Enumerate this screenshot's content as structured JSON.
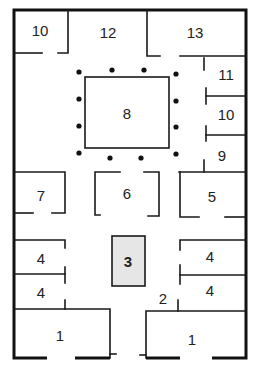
{
  "diagram": {
    "type": "floor-plan",
    "colors": {
      "wall": "#1a1a1a",
      "highlight_fill": "#e6e6e6",
      "column": "#111111",
      "background": "#ffffff"
    },
    "rooms": [
      {
        "id": "r10a",
        "label": "10",
        "x": 40,
        "y": 30
      },
      {
        "id": "r12",
        "label": "12",
        "x": 108,
        "y": 32
      },
      {
        "id": "r13",
        "label": "13",
        "x": 195,
        "y": 32
      },
      {
        "id": "r11",
        "label": "11",
        "x": 226,
        "y": 74
      },
      {
        "id": "r10b",
        "label": "10",
        "x": 226,
        "y": 114
      },
      {
        "id": "r9",
        "label": "9",
        "x": 222,
        "y": 155
      },
      {
        "id": "r8",
        "label": "8",
        "x": 127,
        "y": 113
      },
      {
        "id": "r7",
        "label": "7",
        "x": 41,
        "y": 195
      },
      {
        "id": "r6",
        "label": "6",
        "x": 127,
        "y": 193
      },
      {
        "id": "r5",
        "label": "5",
        "x": 212,
        "y": 196
      },
      {
        "id": "r3",
        "label": "3",
        "x": 128,
        "y": 260,
        "highlight": true
      },
      {
        "id": "r4a",
        "label": "4",
        "x": 41,
        "y": 258
      },
      {
        "id": "r4b",
        "label": "4",
        "x": 41,
        "y": 292
      },
      {
        "id": "r4c",
        "label": "4",
        "x": 210,
        "y": 256
      },
      {
        "id": "r4d",
        "label": "4",
        "x": 210,
        "y": 290
      },
      {
        "id": "r2",
        "label": "2",
        "x": 163,
        "y": 298
      },
      {
        "id": "r1a",
        "label": "1",
        "x": 60,
        "y": 335
      },
      {
        "id": "r1b",
        "label": "1",
        "x": 192,
        "y": 339
      }
    ],
    "columns_count": 16
  }
}
